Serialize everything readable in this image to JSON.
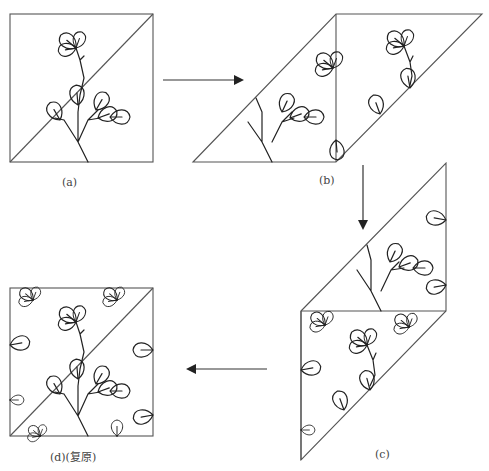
{
  "figure": {
    "panels": [
      {
        "id": "a",
        "label": "(a)",
        "shape": "square split by diagonal"
      },
      {
        "id": "b",
        "label": "(b)",
        "shape": "parallelogram (triangles rearranged)"
      },
      {
        "id": "c",
        "label": "(c)",
        "shape": "stacked parallelograms"
      },
      {
        "id": "d",
        "label": "(d)(复原)",
        "shape": "square restored with repeated pattern"
      }
    ],
    "arrows": [
      {
        "from": "a",
        "to": "b",
        "direction": "right"
      },
      {
        "from": "b",
        "to": "c",
        "direction": "down"
      },
      {
        "from": "c",
        "to": "d",
        "direction": "left"
      }
    ],
    "colors": {
      "line": "#555555",
      "ink": "#222222",
      "background": "#ffffff"
    }
  }
}
